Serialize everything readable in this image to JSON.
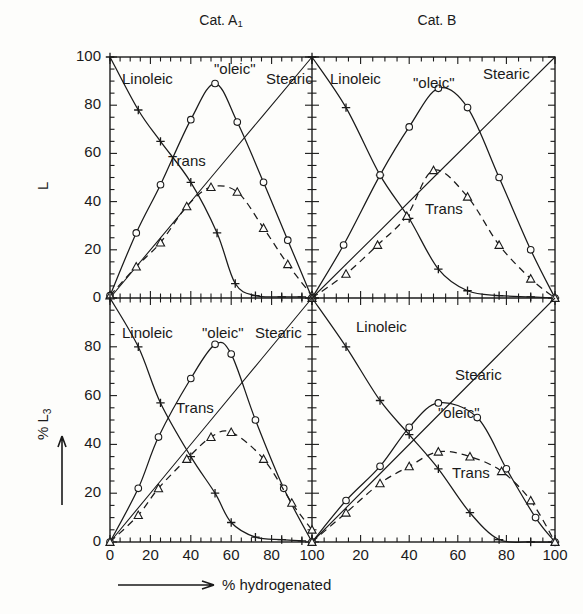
{
  "figure": {
    "caption_x_axis": "% hydrogenated",
    "panel_titles": [
      "Cat. A",
      "Cat. B"
    ],
    "panel_title_sub": "1",
    "y_axis_top_label": "L",
    "y_axis_bottom_label": "% L",
    "y_axis_bottom_sub": "3",
    "series_labels": {
      "linoleic": "Linoleic",
      "oleic": "\"oleic\"",
      "stearic": "Stearic",
      "trans": "Trans"
    },
    "y_ticks": [
      "0",
      "20",
      "40",
      "60",
      "80",
      "100"
    ],
    "x_ticks_left": [
      "0",
      "20",
      "40",
      "60",
      "80",
      "100"
    ],
    "x_ticks_right": [
      "20",
      "40",
      "60",
      "80",
      "100"
    ]
  },
  "chart_data": {
    "type": "line",
    "xlabel": "% hydrogenated",
    "xlim": [
      0,
      100
    ],
    "ylim": [
      0,
      100
    ],
    "grid": false,
    "legend": "inline-annotations",
    "panels": [
      {
        "id": "top-left",
        "title": "Cat. A1",
        "ylabel": "L",
        "ytick_values": [
          0,
          20,
          40,
          60,
          80,
          100
        ],
        "xtick_values": [
          0,
          20,
          40,
          60,
          80,
          100
        ],
        "series": [
          {
            "name": "Linoleic",
            "marker": "plus",
            "linestyle": "solid",
            "points": [
              [
                0,
                100
              ],
              [
                14,
                78
              ],
              [
                25,
                65
              ],
              [
                40,
                48
              ],
              [
                53,
                27
              ],
              [
                62,
                6
              ],
              [
                72,
                1
              ],
              [
                85,
                0.5
              ],
              [
                95,
                0.5
              ]
            ],
            "values": [
              100,
              78,
              65,
              48,
              27,
              6,
              1,
              0.5,
              0.5
            ],
            "x": [
              0,
              14,
              25,
              40,
              53,
              62,
              72,
              85,
              95
            ]
          },
          {
            "name": "\"oleic\"",
            "marker": "circle",
            "linestyle": "solid",
            "points": [
              [
                0,
                1
              ],
              [
                13,
                27
              ],
              [
                25,
                47
              ],
              [
                40,
                74
              ],
              [
                52,
                89
              ],
              [
                63,
                73
              ],
              [
                76,
                48
              ],
              [
                88,
                24
              ],
              [
                100,
                0
              ]
            ],
            "values": [
              1,
              27,
              47,
              74,
              89,
              73,
              48,
              24,
              0
            ],
            "x": [
              0,
              13,
              25,
              40,
              52,
              63,
              76,
              88,
              100
            ]
          },
          {
            "name": "Stearic",
            "marker": "line-only",
            "linestyle": "solid",
            "points": [
              [
                0,
                0
              ],
              [
                25,
                25
              ],
              [
                50,
                50
              ],
              [
                75,
                75
              ],
              [
                100,
                100
              ]
            ],
            "values": [
              0,
              25,
              50,
              75,
              100
            ],
            "x": [
              0,
              25,
              50,
              75,
              100
            ]
          },
          {
            "name": "Trans",
            "marker": "triangle",
            "linestyle": "dashed",
            "points": [
              [
                0,
                1
              ],
              [
                13,
                13
              ],
              [
                25,
                23
              ],
              [
                38,
                38
              ],
              [
                50,
                46
              ],
              [
                63,
                44
              ],
              [
                76,
                29
              ],
              [
                88,
                14
              ],
              [
                100,
                1
              ]
            ],
            "values": [
              1,
              13,
              23,
              38,
              46,
              44,
              29,
              14,
              1
            ],
            "x": [
              0,
              13,
              25,
              38,
              50,
              63,
              76,
              88,
              100
            ]
          }
        ]
      },
      {
        "id": "top-right",
        "title": "Cat. B",
        "ylabel": "L",
        "ytick_values": [
          0,
          20,
          40,
          60,
          80,
          100
        ],
        "xtick_values": [
          0,
          20,
          40,
          60,
          80,
          100
        ],
        "series": [
          {
            "name": "Linoleic",
            "marker": "plus",
            "linestyle": "solid",
            "points": [
              [
                0,
                100
              ],
              [
                14,
                79
              ],
              [
                28,
                51
              ],
              [
                40,
                33
              ],
              [
                52,
                12
              ],
              [
                64,
                3
              ],
              [
                77,
                1
              ],
              [
                90,
                0.5
              ],
              [
                100,
                0
              ]
            ],
            "values": [
              100,
              79,
              51,
              33,
              12,
              3,
              1,
              0.5,
              0
            ],
            "x": [
              0,
              14,
              28,
              40,
              52,
              64,
              77,
              90,
              100
            ]
          },
          {
            "name": "\"oleic\"",
            "marker": "circle",
            "linestyle": "solid",
            "points": [
              [
                0,
                0
              ],
              [
                13,
                22
              ],
              [
                28,
                51
              ],
              [
                40,
                71
              ],
              [
                52,
                87
              ],
              [
                64,
                79
              ],
              [
                77,
                50
              ],
              [
                90,
                20
              ],
              [
                100,
                0
              ]
            ],
            "values": [
              0,
              22,
              51,
              71,
              87,
              79,
              50,
              20,
              0
            ],
            "x": [
              0,
              13,
              28,
              40,
              52,
              64,
              77,
              90,
              100
            ]
          },
          {
            "name": "Stearic",
            "marker": "line-only",
            "linestyle": "solid",
            "points": [
              [
                0,
                0
              ],
              [
                25,
                25
              ],
              [
                50,
                50
              ],
              [
                75,
                75
              ],
              [
                100,
                100
              ]
            ],
            "values": [
              0,
              25,
              50,
              75,
              100
            ],
            "x": [
              0,
              25,
              50,
              75,
              100
            ]
          },
          {
            "name": "Trans",
            "marker": "triangle",
            "linestyle": "dashed",
            "points": [
              [
                0,
                0
              ],
              [
                14,
                10
              ],
              [
                27,
                22
              ],
              [
                39,
                34
              ],
              [
                50,
                53
              ],
              [
                64,
                42
              ],
              [
                77,
                22
              ],
              [
                90,
                8
              ],
              [
                100,
                0
              ]
            ],
            "values": [
              0,
              10,
              22,
              34,
              53,
              42,
              22,
              8,
              0
            ],
            "x": [
              0,
              14,
              27,
              39,
              50,
              64,
              77,
              90,
              100
            ]
          }
        ]
      },
      {
        "id": "bottom-left",
        "title": "Cat. A1",
        "ylabel": "% L3",
        "ytick_values": [
          0,
          20,
          40,
          60,
          80,
          100
        ],
        "xtick_values": [
          0,
          20,
          40,
          60,
          80,
          100
        ],
        "series": [
          {
            "name": "Linoleic",
            "marker": "plus",
            "linestyle": "solid",
            "points": [
              [
                0,
                100
              ],
              [
                14,
                80
              ],
              [
                25,
                57
              ],
              [
                40,
                35
              ],
              [
                52,
                20
              ],
              [
                60,
                8
              ],
              [
                72,
                2
              ],
              [
                85,
                1
              ],
              [
                95,
                0.5
              ]
            ],
            "values": [
              100,
              80,
              57,
              35,
              20,
              8,
              2,
              1,
              0.5
            ],
            "x": [
              0,
              14,
              25,
              40,
              52,
              60,
              72,
              85,
              95
            ]
          },
          {
            "name": "\"oleic\"",
            "marker": "circle",
            "linestyle": "solid",
            "points": [
              [
                0,
                0
              ],
              [
                14,
                22
              ],
              [
                24,
                43
              ],
              [
                40,
                67
              ],
              [
                52,
                81
              ],
              [
                60,
                77
              ],
              [
                72,
                50
              ],
              [
                86,
                22
              ],
              [
                100,
                0
              ]
            ],
            "values": [
              0,
              22,
              43,
              67,
              81,
              77,
              50,
              22,
              0
            ],
            "x": [
              0,
              14,
              24,
              40,
              52,
              60,
              72,
              86,
              100
            ]
          },
          {
            "name": "Stearic",
            "marker": "line-only",
            "linestyle": "solid",
            "points": [
              [
                0,
                0
              ],
              [
                25,
                25
              ],
              [
                50,
                50
              ],
              [
                75,
                75
              ],
              [
                100,
                100
              ]
            ],
            "values": [
              0,
              25,
              50,
              75,
              100
            ],
            "x": [
              0,
              25,
              50,
              75,
              100
            ]
          },
          {
            "name": "Trans",
            "marker": "triangle",
            "linestyle": "dashed",
            "points": [
              [
                0,
                0
              ],
              [
                14,
                11
              ],
              [
                24,
                22
              ],
              [
                38,
                34
              ],
              [
                50,
                43
              ],
              [
                60,
                45
              ],
              [
                76,
                34
              ],
              [
                90,
                16
              ],
              [
                100,
                5
              ]
            ],
            "values": [
              0,
              11,
              22,
              34,
              43,
              45,
              34,
              16,
              5
            ],
            "x": [
              0,
              14,
              24,
              38,
              50,
              60,
              76,
              90,
              100
            ]
          }
        ]
      },
      {
        "id": "bottom-right",
        "title": "Cat. B",
        "ylabel": "% L3",
        "ytick_values": [
          0,
          20,
          40,
          60,
          80,
          100
        ],
        "xtick_values": [
          0,
          20,
          40,
          60,
          80,
          100
        ],
        "series": [
          {
            "name": "Linoleic",
            "marker": "plus",
            "linestyle": "solid",
            "points": [
              [
                0,
                100
              ],
              [
                14,
                80
              ],
              [
                28,
                58
              ],
              [
                40,
                44
              ],
              [
                52,
                30
              ],
              [
                65,
                12
              ],
              [
                77,
                1
              ],
              [
                90,
                0
              ],
              [
                100,
                0
              ]
            ],
            "values": [
              100,
              80,
              58,
              44,
              30,
              12,
              1,
              0,
              0
            ],
            "x": [
              0,
              14,
              28,
              40,
              52,
              65,
              77,
              90,
              100
            ]
          },
          {
            "name": "\"oleic\"",
            "marker": "circle",
            "linestyle": "solid",
            "points": [
              [
                0,
                0
              ],
              [
                14,
                17
              ],
              [
                28,
                31
              ],
              [
                40,
                47
              ],
              [
                52,
                57
              ],
              [
                68,
                51
              ],
              [
                80,
                30
              ],
              [
                92,
                10
              ],
              [
                100,
                0
              ]
            ],
            "values": [
              0,
              17,
              31,
              47,
              57,
              51,
              30,
              10,
              0
            ],
            "x": [
              0,
              14,
              28,
              40,
              52,
              68,
              80,
              92,
              100
            ]
          },
          {
            "name": "Stearic",
            "marker": "line-only",
            "linestyle": "solid",
            "points": [
              [
                0,
                0
              ],
              [
                25,
                25
              ],
              [
                50,
                50
              ],
              [
                75,
                75
              ],
              [
                100,
                100
              ]
            ],
            "values": [
              0,
              25,
              50,
              75,
              100
            ],
            "x": [
              0,
              25,
              50,
              75,
              100
            ]
          },
          {
            "name": "Trans",
            "marker": "triangle",
            "linestyle": "dashed",
            "points": [
              [
                0,
                0
              ],
              [
                14,
                12
              ],
              [
                28,
                24
              ],
              [
                40,
                31
              ],
              [
                52,
                37
              ],
              [
                65,
                35
              ],
              [
                78,
                29
              ],
              [
                90,
                17
              ],
              [
                100,
                0
              ]
            ],
            "values": [
              0,
              12,
              24,
              31,
              37,
              35,
              29,
              17,
              0
            ],
            "x": [
              0,
              14,
              28,
              40,
              52,
              65,
              78,
              90,
              100
            ]
          }
        ]
      }
    ]
  }
}
